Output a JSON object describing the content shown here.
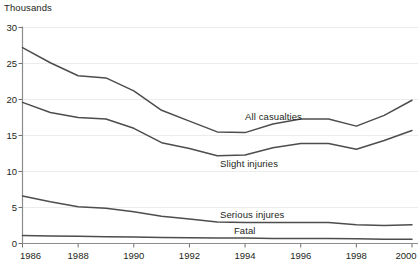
{
  "chart_data": {
    "type": "line",
    "title": "",
    "subtitle": "",
    "ylabel": "Thousands",
    "xlabel": "",
    "grid": true,
    "legend_position": "inline-annotations",
    "ylim": [
      0,
      30
    ],
    "yticks": [
      0,
      5,
      10,
      15,
      20,
      25,
      30
    ],
    "ytick_labels": [
      "0",
      "5",
      "10",
      "15",
      "20",
      "25",
      "30"
    ],
    "xlim": [
      1986,
      2000
    ],
    "x": [
      1986,
      1987,
      1988,
      1989,
      1990,
      1991,
      1992,
      1993,
      1994,
      1995,
      1996,
      1997,
      1998,
      1999,
      2000
    ],
    "xticks": [
      1986,
      1988,
      1990,
      1992,
      1994,
      1996,
      1998,
      2000
    ],
    "xtick_labels": [
      "1986",
      "1988",
      "1990",
      "1992",
      "1994",
      "1996",
      "1998",
      "2000"
    ],
    "series": [
      {
        "name": "All casualties",
        "color": "#4d4d4d",
        "values": [
          27.2,
          25.1,
          23.3,
          23.0,
          21.2,
          18.5,
          17.0,
          15.5,
          15.4,
          16.6,
          17.3,
          17.3,
          16.3,
          17.8,
          19.9
        ]
      },
      {
        "name": "Slight injuries",
        "color": "#4d4d4d",
        "values": [
          19.6,
          18.2,
          17.5,
          17.3,
          16.0,
          14.0,
          13.2,
          12.2,
          12.3,
          13.3,
          13.9,
          13.9,
          13.1,
          14.3,
          15.7
        ]
      },
      {
        "name": "Serious injures",
        "color": "#4d4d4d",
        "values": [
          6.6,
          5.8,
          5.1,
          4.9,
          4.4,
          3.8,
          3.4,
          3.0,
          2.9,
          2.9,
          2.9,
          2.9,
          2.6,
          2.5,
          2.6
        ]
      },
      {
        "name": "Fatal",
        "color": "#4d4d4d",
        "values": [
          1.1,
          1.05,
          1.0,
          0.95,
          0.9,
          0.85,
          0.8,
          0.75,
          0.75,
          0.7,
          0.7,
          0.7,
          0.65,
          0.6,
          0.6
        ]
      }
    ],
    "annotations": [
      {
        "text": "All casualties",
        "x": 1994.0,
        "y": 17.6
      },
      {
        "text": "Slight injuries",
        "x": 1993.1,
        "y": 11.0
      },
      {
        "text": "Serious injures",
        "x": 1993.1,
        "y": 3.9
      },
      {
        "text": "Fatal",
        "x": 1993.6,
        "y": 1.8
      }
    ]
  }
}
